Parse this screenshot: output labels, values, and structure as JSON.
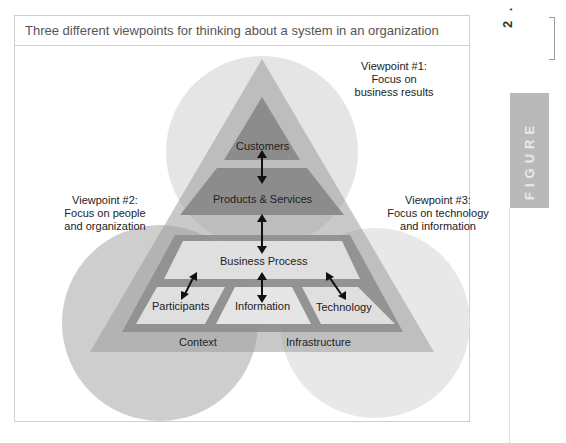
{
  "figure": {
    "title": "Three different viewpoints for thinking about a system in an organization",
    "number": "2 . 5",
    "tab_label": "FIGURE"
  },
  "viewpoints": [
    {
      "id": 1,
      "lines": [
        "Viewpoint #1:",
        "Focus on",
        "business results"
      ]
    },
    {
      "id": 2,
      "lines": [
        "Viewpoint #2:",
        "Focus on people",
        "and organization"
      ]
    },
    {
      "id": 3,
      "lines": [
        "Viewpoint #3:",
        "Focus on technology",
        "and information"
      ]
    }
  ],
  "layers": {
    "customers": "Customers",
    "products_services": "Products & Services",
    "business_process": "Business Process",
    "participants": "Participants",
    "information": "Information",
    "technology": "Technology",
    "context": "Context",
    "infrastructure": "Infrastructure"
  },
  "colors": {
    "circle_top": "#e4e4e4",
    "circle_left": "#c8c8c8",
    "circle_right": "#e8e8e8",
    "outer_triangle": "#b4b4b4",
    "inner_dark": "#8f8f8f",
    "panel_fill": "#e6e6e6",
    "arrow": "#111111"
  }
}
